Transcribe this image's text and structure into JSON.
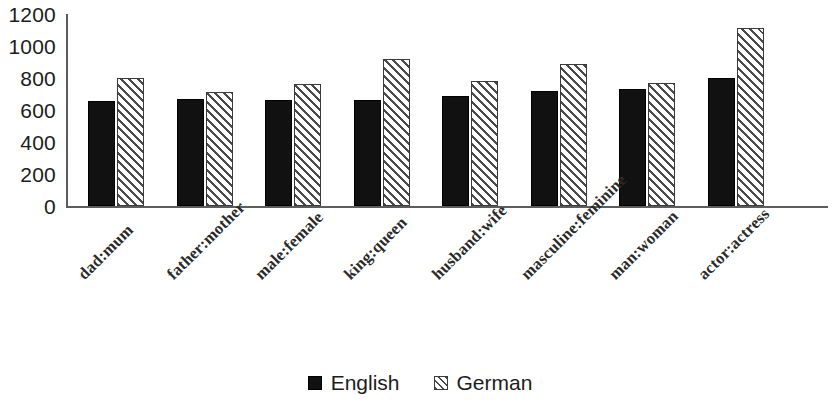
{
  "chart_data": {
    "type": "bar",
    "title": "",
    "subtitle": "",
    "xlabel": "",
    "ylabel": "",
    "ylim": [
      0,
      1200
    ],
    "yticks": [
      0,
      200,
      400,
      600,
      800,
      1000,
      1200
    ],
    "ytick_labels": [
      "0",
      "200",
      "400",
      "600",
      "800",
      "1000",
      "1200"
    ],
    "grid": false,
    "legend_position": "bottom-center",
    "categories": [
      "dad:mum",
      "father:mother",
      "male:female",
      "king:queen",
      "husband:wife",
      "masculine:feminine",
      "man:woman",
      "actor:actress"
    ],
    "series": [
      {
        "name": "English",
        "color": "#111111",
        "pattern": "solid",
        "values": [
          655,
          670,
          660,
          665,
          690,
          720,
          730,
          800
        ]
      },
      {
        "name": "German",
        "color": "#ffffff",
        "pattern": "diagonal-hatch",
        "values": [
          800,
          710,
          760,
          920,
          780,
          890,
          770,
          1110
        ]
      }
    ]
  },
  "legend": {
    "entries": [
      {
        "label": "English",
        "swatch": "solid-black-square"
      },
      {
        "label": "German",
        "swatch": "hatched-square"
      }
    ]
  }
}
